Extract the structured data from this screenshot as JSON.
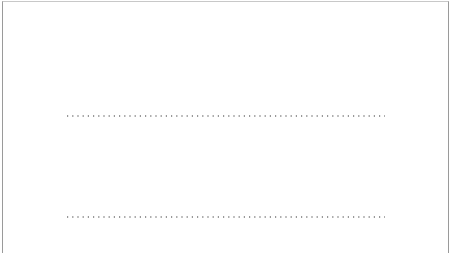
{
  "chart_data": [
    {
      "type": "line",
      "title": "",
      "xlabel": "",
      "ylabel": "",
      "xlim": [
        1,
        10
      ],
      "x_ticks": [
        2,
        3,
        4,
        5,
        6,
        7,
        8,
        9
      ],
      "x_tick_labels": {
        "2": "2",
        "9": "9"
      },
      "grid": false,
      "legend": null,
      "series": [
        {
          "name": "dashed-curve",
          "style": "dashed",
          "support": [
            4,
            7
          ],
          "peak_x": 5.5,
          "peak_height": 1.0
        }
      ]
    },
    {
      "type": "line",
      "title": "",
      "xlabel": "",
      "ylabel": "",
      "xlim": [
        1,
        10
      ],
      "x_ticks": [
        2,
        3,
        4,
        5,
        5.5,
        6,
        7,
        8,
        9
      ],
      "x_tick_labels": {
        "2": "2",
        "9": "9"
      },
      "grid": false,
      "legend": null,
      "series": [
        {
          "name": "dotted-curve-left",
          "style": "dotted",
          "support": [
            4,
            6
          ],
          "peak_x": 5.2,
          "peak_height": 0.8
        },
        {
          "name": "dotted-curve-right",
          "style": "dotted",
          "support": [
            5,
            7
          ],
          "peak_x": 5.8,
          "peak_height": 0.8
        }
      ]
    }
  ],
  "panels": {
    "top": {
      "label_left": "2",
      "label_right": "9"
    },
    "bottom": {
      "label_left": "2",
      "label_right": "9"
    }
  }
}
